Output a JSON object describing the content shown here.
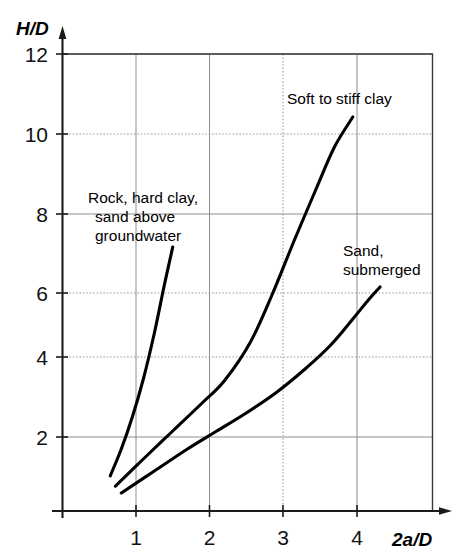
{
  "chart_data": {
    "type": "line",
    "title": "",
    "xlabel": "2a/D",
    "ylabel": "H/D",
    "xlim": [
      0,
      5.05
    ],
    "ylim": [
      0,
      12.8
    ],
    "xticks": [
      "1",
      "2",
      "3",
      "4"
    ],
    "xtick_values": [
      1,
      2,
      3,
      4
    ],
    "yticks": [
      "2",
      "4",
      "6",
      "8",
      "10",
      "12"
    ],
    "ytick_values": [
      2,
      4,
      6,
      8,
      10,
      12
    ],
    "grid": true,
    "legend": "inline-annotations",
    "series": [
      {
        "name": "Rock, hard clay, sand above groundwater",
        "label_lines": [
          "Rock, hard clay,",
          "sand above",
          "groundwater"
        ],
        "points": [
          [
            0.65,
            0.88
          ],
          [
            0.8,
            1.55
          ],
          [
            0.95,
            2.35
          ],
          [
            1.1,
            3.3
          ],
          [
            1.25,
            4.45
          ],
          [
            1.38,
            5.6
          ],
          [
            1.5,
            6.6
          ]
        ]
      },
      {
        "name": "Soft to stiff clay",
        "label_lines": [
          "Soft to stiff clay"
        ],
        "points": [
          [
            0.72,
            0.62
          ],
          [
            1.1,
            1.3
          ],
          [
            1.5,
            2.0
          ],
          [
            1.9,
            2.7
          ],
          [
            2.2,
            3.25
          ],
          [
            2.55,
            4.2
          ],
          [
            2.85,
            5.4
          ],
          [
            3.15,
            6.75
          ],
          [
            3.45,
            8.05
          ],
          [
            3.7,
            9.1
          ],
          [
            3.95,
            9.85
          ]
        ]
      },
      {
        "name": "Sand, submerged",
        "label_lines": [
          "Sand,",
          "submerged"
        ],
        "points": [
          [
            0.8,
            0.45
          ],
          [
            1.25,
            1.0
          ],
          [
            1.7,
            1.55
          ],
          [
            2.1,
            2.0
          ],
          [
            2.5,
            2.45
          ],
          [
            2.9,
            2.95
          ],
          [
            3.3,
            3.55
          ],
          [
            3.65,
            4.15
          ],
          [
            3.95,
            4.8
          ],
          [
            4.15,
            5.25
          ],
          [
            4.32,
            5.6
          ]
        ]
      }
    ],
    "annotations": [
      {
        "id": "rock-label",
        "text": "Rock, hard clay, sand above groundwater",
        "x_px": 150,
        "y_px": 200
      },
      {
        "id": "clay-label",
        "text": "Soft to stiff clay",
        "x_px": 287,
        "y_px": 102
      },
      {
        "id": "sand-label",
        "text": "Sand, submerged",
        "x_px": 343,
        "y_px": 253
      }
    ]
  },
  "axes": {
    "y_title": "H/D",
    "x_title": "2a/D"
  },
  "labels": {
    "y_12": "12",
    "y_10": "10",
    "y_8": "8",
    "y_6": "6",
    "y_4": "4",
    "y_2": "2",
    "x_1": "1",
    "x_2": "2",
    "x_3": "3",
    "x_4": "4"
  },
  "curve_labels": {
    "rock_line1": "Rock, hard clay,",
    "rock_line2": "sand above",
    "rock_line3": "groundwater",
    "clay_line1": "Soft to stiff clay",
    "sand_line1": "Sand,",
    "sand_line2": "submerged"
  },
  "colors": {
    "curve": "#000000",
    "grid_solid": "#8d8d8d",
    "grid_dotted": "#9a9a9a",
    "frame": "#3a3a3a",
    "axis": "#1b1b1b",
    "background": "#ffffff"
  }
}
